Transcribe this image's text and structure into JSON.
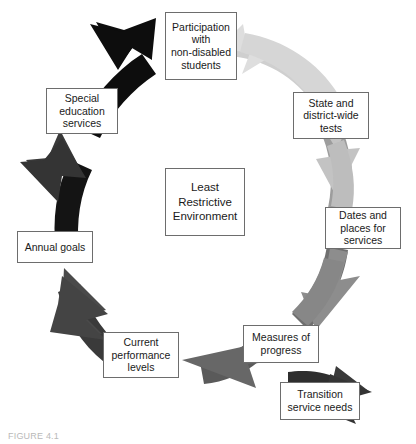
{
  "figure": {
    "center_label": "Least\nRestrictive\nEnvironment",
    "caption": "FIGURE 4.1",
    "box_border_color": "#6d6d6d",
    "background_color": "#ffffff",
    "text_color": "#1a1a1a"
  },
  "nodes": [
    {
      "id": "participation",
      "label": "Participation\nwith\nnon-disabled\nstudents",
      "position": "top"
    },
    {
      "id": "state-tests",
      "label": "State and\ndistrict-wide\ntests",
      "position": "upper-right"
    },
    {
      "id": "dates-places",
      "label": "Dates and\nplaces for\nservices",
      "position": "right"
    },
    {
      "id": "measures",
      "label": "Measures of\nprogress",
      "position": "lower-right"
    },
    {
      "id": "transition",
      "label": "Transition\nservice needs",
      "position": "bottom-right"
    },
    {
      "id": "current-levels",
      "label": "Current\nperformance\nlevels",
      "position": "lower-left"
    },
    {
      "id": "annual-goals",
      "label": "Annual goals",
      "position": "left"
    },
    {
      "id": "special-education",
      "label": "Special\neducation\nservices",
      "position": "upper-left"
    }
  ],
  "arrows": [
    {
      "id": "arrow-1",
      "from": "participation",
      "to": "state-tests",
      "color": "#dcdcdc",
      "tail_color": "#c9c9c9"
    },
    {
      "id": "arrow-2",
      "from": "state-tests",
      "to": "dates-places",
      "color": "#c2c2c2",
      "tail_color": "#9b9b9b"
    },
    {
      "id": "arrow-3",
      "from": "dates-places",
      "to": "measures",
      "color": "#8d8d8d",
      "tail_color": "#6f6f6f"
    },
    {
      "id": "arrow-4",
      "from": "transition",
      "to": "measures",
      "color": "#3a3a3a",
      "tail_color": "#2e2e2e"
    },
    {
      "id": "arrow-5",
      "from": "measures",
      "to": "current-levels",
      "color": "#6e6e6e",
      "tail_color": "#5a5a5a"
    },
    {
      "id": "arrow-6",
      "from": "current-levels",
      "to": "annual-goals",
      "color": "#4a4a4a",
      "tail_color": "#3a3a3a"
    },
    {
      "id": "arrow-7",
      "from": "annual-goals",
      "to": "special-education",
      "color": "#3a3a3a",
      "tail_color": "#141414"
    },
    {
      "id": "arrow-8",
      "from": "special-education",
      "to": "participation",
      "color": "#0d0d0d",
      "tail_color": "#0d0d0d"
    }
  ]
}
